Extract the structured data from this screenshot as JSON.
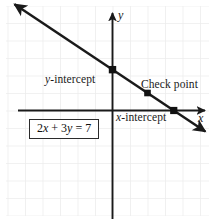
{
  "figure": {
    "equation_label": "2x + 3y = 7",
    "equation_parts": {
      "coef_x": "2",
      "var_x": "x",
      "plus": "+",
      "coef_y": "3",
      "var_y": "y",
      "equals": "=",
      "constant": "7"
    },
    "axis_label_x": "x",
    "axis_label_y": "y",
    "labels": {
      "y_intercept": "y-intercept",
      "x_intercept": "x-intercept",
      "check_point": "Check point"
    },
    "colors": {
      "line": "#1a1a1a",
      "axis": "#1a1a1a",
      "grid": "#ececec",
      "background": "#ffffff",
      "point": "#111111",
      "box_border": "#2b2b2b"
    }
  },
  "chart_data": {
    "type": "line",
    "title": "2x + 3y = 7",
    "xlabel": "x",
    "ylabel": "y",
    "grid": true,
    "legend_position": "none",
    "equation": "2x + 3y = 7",
    "slope": -0.6666666667,
    "y_intercept_value": 2.3333333333,
    "x_intercept_value": 3.5,
    "xlim": [
      -6,
      6
    ],
    "ylim": [
      -6,
      6
    ],
    "grid_spacing": 1,
    "series": [
      {
        "name": "2x + 3y = 7",
        "x": [
          -5.6,
          5.3
        ],
        "y": [
          6.07,
          -1.2
        ]
      }
    ],
    "annotated_points": [
      {
        "label": "y-intercept",
        "x": 0,
        "y": 2.3333333333,
        "marker": "square"
      },
      {
        "label": "Check point",
        "x": 2,
        "y": 1,
        "marker": "square"
      },
      {
        "label": "x-intercept",
        "x": 3.5,
        "y": 0,
        "marker": "square"
      }
    ],
    "axis_arrows": {
      "x_right": true,
      "x_left": false,
      "y_up": true,
      "y_down": false
    },
    "line_arrows": {
      "upper_left": true,
      "lower_right": true
    }
  }
}
